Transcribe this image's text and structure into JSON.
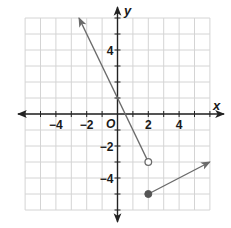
{
  "chart_data": {
    "type": "line",
    "title": "",
    "xlabel": "x",
    "ylabel": "y",
    "origin_label": "O",
    "xlim": [
      -6,
      6
    ],
    "ylim": [
      -6,
      6
    ],
    "grid": true,
    "x_tick_labels": [
      {
        "value": -4,
        "label": "−4"
      },
      {
        "value": -2,
        "label": "−2"
      },
      {
        "value": 2,
        "label": "2"
      },
      {
        "value": 4,
        "label": "4"
      }
    ],
    "y_tick_labels": [
      {
        "value": 4,
        "label": "4"
      },
      {
        "value": -2,
        "label": "−2"
      },
      {
        "value": -4,
        "label": "−4"
      }
    ],
    "series": [
      {
        "name": "piece-1",
        "equation": "y = -2x + 1, x < 2",
        "points": [
          [
            -2.5,
            6
          ],
          [
            2,
            -3
          ]
        ],
        "start_arrow": true,
        "end_marker": "open-circle",
        "color": "#6b6b6b"
      },
      {
        "name": "piece-2",
        "equation": "y = 0.5x - 6, x >= 2",
        "points": [
          [
            2,
            -5
          ],
          [
            6,
            -3
          ]
        ],
        "start_marker": "closed-circle",
        "end_arrow": true,
        "color": "#6b6b6b"
      }
    ]
  },
  "colors": {
    "grid": "#d4d4d4",
    "axis": "#222222",
    "series": "#6b6b6b",
    "closed_point": "#555555"
  }
}
